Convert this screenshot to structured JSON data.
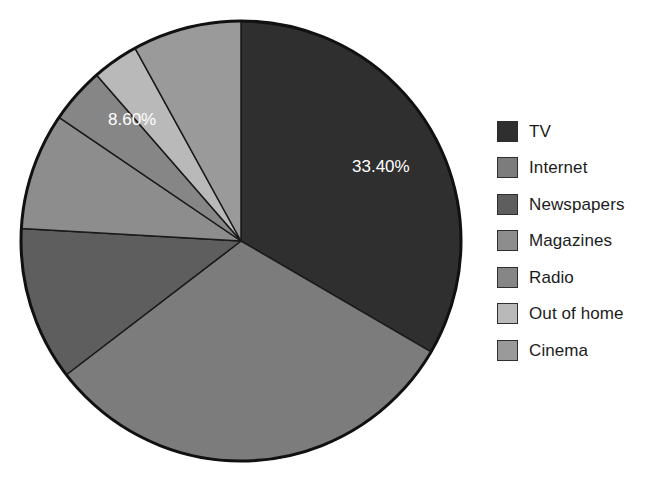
{
  "chart_data": {
    "type": "pie",
    "title": "",
    "subtitle": "",
    "xlabel": "",
    "ylabel": "",
    "grid": false,
    "legend_position": "right",
    "start_angle_deg": 0,
    "direction": "clockwise",
    "center": {
      "x": 241,
      "y": 241
    },
    "radius": 220,
    "categories": [
      "TV",
      "Internet",
      "Newspapers",
      "Magazines",
      "Radio",
      "Out of home",
      "Cinema"
    ],
    "values": [
      33.4,
      31.2,
      11.3,
      8.6,
      4.1,
      3.4,
      8.0
    ],
    "unit": "%",
    "colors": [
      "#2f2f2f",
      "#7c7c7c",
      "#5e5e5e",
      "#8d8d8d",
      "#868686",
      "#b9b9b9",
      "#9a9a9a"
    ],
    "slices": [
      {
        "name": "TV",
        "value": 33.4,
        "color": "#2f2f2f",
        "label": "33.40%",
        "label_shown": true,
        "label_color": "#ffffff"
      },
      {
        "name": "Internet",
        "value": 31.2,
        "color": "#7c7c7c",
        "label": "",
        "label_shown": false,
        "label_color": "#ffffff"
      },
      {
        "name": "Newspapers",
        "value": 11.3,
        "color": "#5e5e5e",
        "label": "",
        "label_shown": false,
        "label_color": "#ffffff"
      },
      {
        "name": "Magazines",
        "value": 8.6,
        "color": "#8d8d8d",
        "label": "8.60%",
        "label_shown": true,
        "label_color": "#ffffff"
      },
      {
        "name": "Radio",
        "value": 4.1,
        "color": "#868686",
        "label": "",
        "label_shown": false,
        "label_color": "#ffffff"
      },
      {
        "name": "Out of home",
        "value": 3.4,
        "color": "#b9b9b9",
        "label": "",
        "label_shown": false,
        "label_color": "#ffffff"
      },
      {
        "name": "Cinema",
        "value": 8.0,
        "color": "#9a9a9a",
        "label": "",
        "label_shown": false,
        "label_color": "#ffffff"
      }
    ],
    "data_labels": [
      {
        "text": "33.40%",
        "slice": "TV",
        "x": 352,
        "y": 172
      },
      {
        "text": "8.60%",
        "slice": "Magazines",
        "x": 108,
        "y": 125
      }
    ],
    "style": {
      "slice_border_color": "#1a1a1a",
      "slice_border_width": 1.5,
      "outline_color": "#111111",
      "outline_width": 3,
      "background": "#ffffff",
      "text_color": "#1c1c1c"
    }
  },
  "legend": {
    "items": [
      {
        "label": "TV",
        "color": "#2f2f2f"
      },
      {
        "label": "Internet",
        "color": "#7c7c7c"
      },
      {
        "label": "Newspapers",
        "color": "#5e5e5e"
      },
      {
        "label": "Magazines",
        "color": "#8d8d8d"
      },
      {
        "label": "Radio",
        "color": "#868686"
      },
      {
        "label": "Out of home",
        "color": "#b9b9b9"
      },
      {
        "label": "Cinema",
        "color": "#9a9a9a"
      }
    ]
  }
}
